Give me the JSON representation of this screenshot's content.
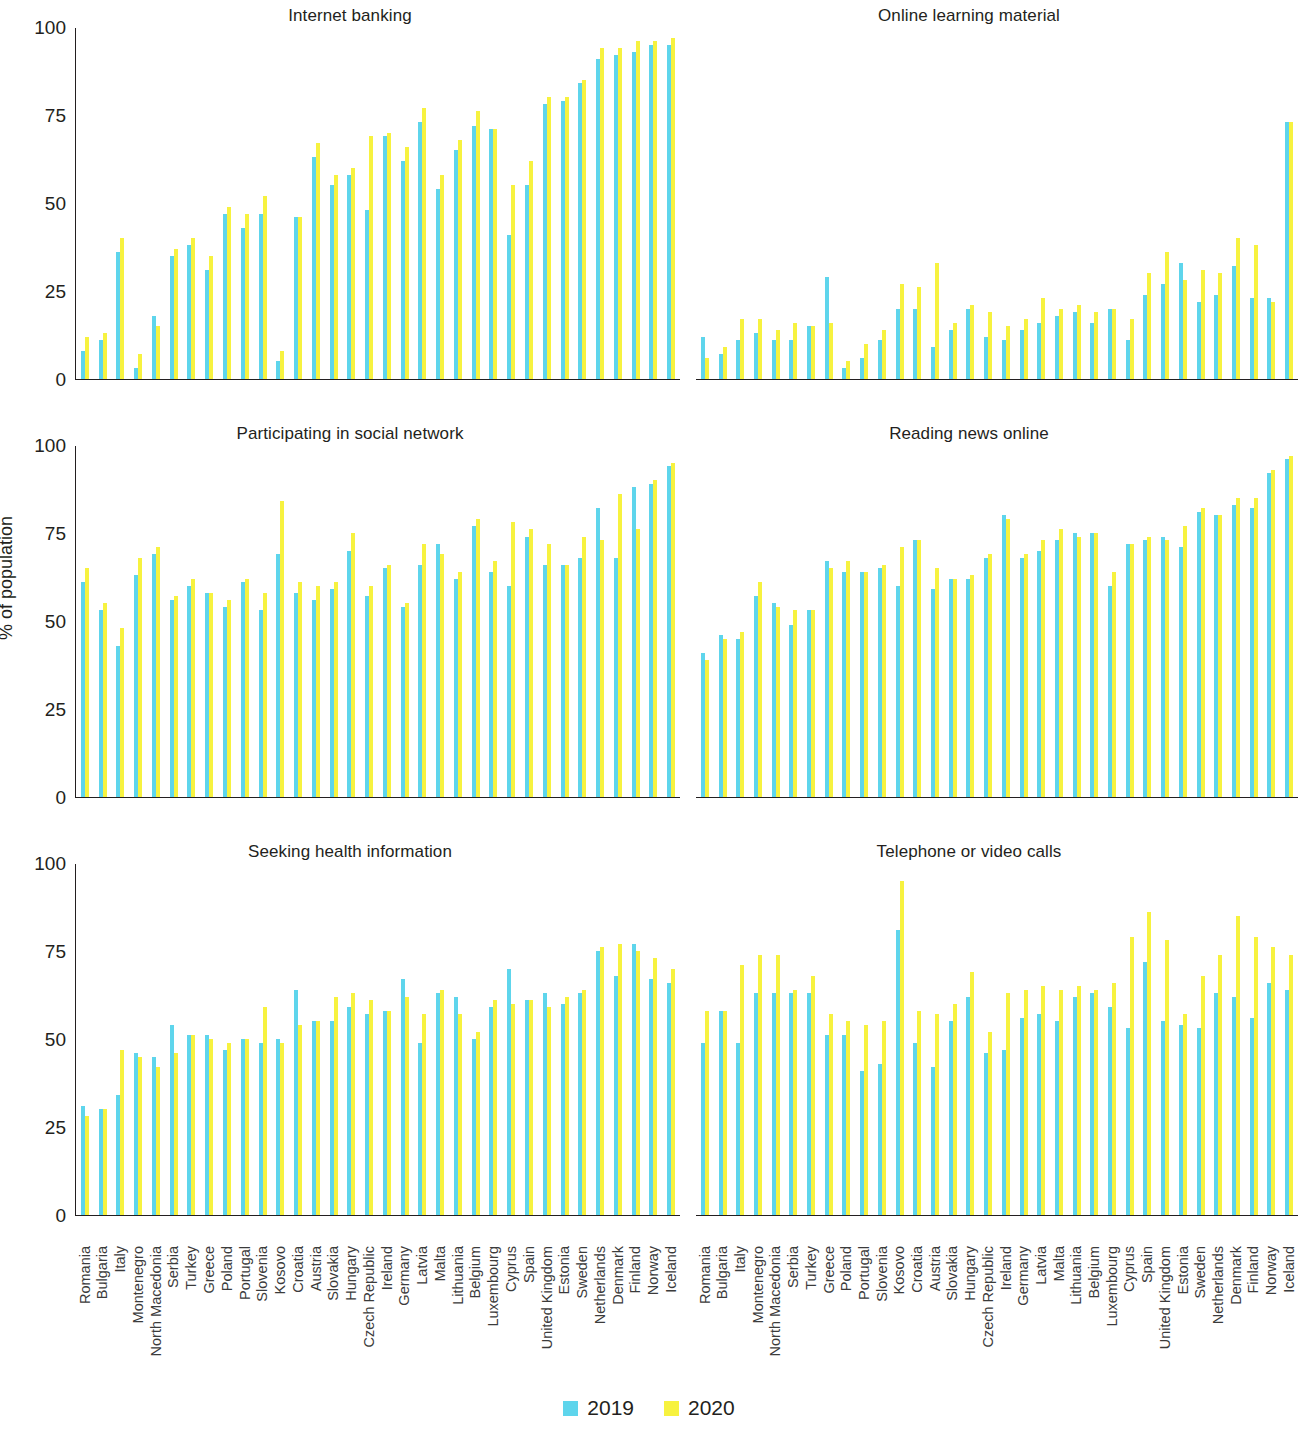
{
  "axis": {
    "ylabel": "% of population",
    "yticks": [
      0,
      25,
      50,
      75,
      100
    ],
    "ymin": 0,
    "ymax": 100
  },
  "legend": {
    "position": "bottom-center",
    "entries": [
      {
        "label": "2019",
        "color": "#5ED5EC"
      },
      {
        "label": "2020",
        "color": "#F7F23F"
      }
    ]
  },
  "colors": {
    "series_2019": "#5ED5EC",
    "series_2020": "#F7F23F",
    "axis": "#231f20",
    "text": "#231f20",
    "background": "#ffffff"
  },
  "countries": [
    "Romania",
    "Bulgaria",
    "Italy",
    "Montenegro",
    "North Macedonia",
    "Serbia",
    "Turkey",
    "Greece",
    "Poland",
    "Portugal",
    "Slovenia",
    "Kosovo",
    "Croatia",
    "Austria",
    "Slovakia",
    "Hungary",
    "Czech Republic",
    "Ireland",
    "Germany",
    "Latvia",
    "Malta",
    "Lithuania",
    "Belgium",
    "Luxembourg",
    "Cyprus",
    "Spain",
    "United Kingdom",
    "Estonia",
    "Sweden",
    "Netherlands",
    "Denmark",
    "Finland",
    "Norway",
    "Iceland"
  ],
  "chart_data": [
    {
      "type": "bar",
      "title": "Internet banking",
      "panel": "top-left",
      "xlabel": "",
      "ylabel": "% of population",
      "ylim": [
        0,
        100
      ],
      "yticks": [
        0,
        25,
        50,
        75,
        100
      ],
      "grid": false,
      "categories": [
        "Romania",
        "Bulgaria",
        "Italy",
        "Montenegro",
        "North Macedonia",
        "Serbia",
        "Turkey",
        "Greece",
        "Poland",
        "Portugal",
        "Slovenia",
        "Kosovo",
        "Croatia",
        "Austria",
        "Slovakia",
        "Hungary",
        "Czech Republic",
        "Ireland",
        "Germany",
        "Latvia",
        "Malta",
        "Lithuania",
        "Belgium",
        "Luxembourg",
        "Cyprus",
        "Spain",
        "United Kingdom",
        "Estonia",
        "Sweden",
        "Netherlands",
        "Denmark",
        "Finland",
        "Norway",
        "Iceland"
      ],
      "series": [
        {
          "name": "2019",
          "color": "#5ED5EC",
          "values": [
            8,
            11,
            36,
            3,
            18,
            35,
            38,
            31,
            47,
            43,
            47,
            5,
            46,
            63,
            55,
            58,
            48,
            69,
            62,
            73,
            54,
            65,
            72,
            71,
            41,
            55,
            78,
            79,
            84,
            91,
            92,
            93,
            95,
            95
          ]
        },
        {
          "name": "2020",
          "color": "#F7F23F",
          "values": [
            12,
            13,
            40,
            7,
            15,
            37,
            40,
            35,
            49,
            47,
            52,
            8,
            46,
            67,
            58,
            60,
            69,
            70,
            66,
            77,
            58,
            68,
            76,
            71,
            55,
            62,
            80,
            80,
            85,
            94,
            94,
            96,
            96,
            97
          ]
        }
      ]
    },
    {
      "type": "bar",
      "title": "Online learning material",
      "panel": "top-right",
      "xlabel": "",
      "ylabel": "",
      "ylim": [
        0,
        100
      ],
      "yticks": [
        0,
        25,
        50,
        75,
        100
      ],
      "grid": false,
      "categories": [
        "Romania",
        "Bulgaria",
        "Italy",
        "Montenegro",
        "North Macedonia",
        "Serbia",
        "Turkey",
        "Greece",
        "Poland",
        "Portugal",
        "Slovenia",
        "Kosovo",
        "Croatia",
        "Austria",
        "Slovakia",
        "Hungary",
        "Czech Republic",
        "Ireland",
        "Germany",
        "Latvia",
        "Malta",
        "Lithuania",
        "Belgium",
        "Luxembourg",
        "Cyprus",
        "Spain",
        "United Kingdom",
        "Estonia",
        "Sweden",
        "Netherlands",
        "Denmark",
        "Finland",
        "Norway",
        "Iceland"
      ],
      "series": [
        {
          "name": "2019",
          "color": "#5ED5EC",
          "values": [
            12,
            7,
            11,
            13,
            11,
            11,
            15,
            29,
            3,
            6,
            11,
            20,
            20,
            9,
            14,
            20,
            12,
            11,
            14,
            16,
            18,
            19,
            16,
            20,
            11,
            24,
            27,
            33,
            22,
            24,
            32,
            23,
            23,
            73
          ]
        },
        {
          "name": "2020",
          "color": "#F7F23F",
          "values": [
            6,
            9,
            17,
            17,
            14,
            16,
            15,
            16,
            5,
            10,
            14,
            27,
            26,
            33,
            16,
            21,
            19,
            15,
            17,
            23,
            20,
            21,
            19,
            20,
            17,
            30,
            36,
            28,
            31,
            30,
            40,
            38,
            22,
            73
          ]
        }
      ]
    },
    {
      "type": "bar",
      "title": "Participating in social network",
      "panel": "middle-left",
      "xlabel": "",
      "ylabel": "% of population",
      "ylim": [
        0,
        100
      ],
      "yticks": [
        0,
        25,
        50,
        75,
        100
      ],
      "grid": false,
      "categories": [
        "Romania",
        "Bulgaria",
        "Italy",
        "Montenegro",
        "North Macedonia",
        "Serbia",
        "Turkey",
        "Greece",
        "Poland",
        "Portugal",
        "Slovenia",
        "Kosovo",
        "Croatia",
        "Austria",
        "Slovakia",
        "Hungary",
        "Czech Republic",
        "Ireland",
        "Germany",
        "Latvia",
        "Malta",
        "Lithuania",
        "Belgium",
        "Luxembourg",
        "Cyprus",
        "Spain",
        "United Kingdom",
        "Estonia",
        "Sweden",
        "Netherlands",
        "Denmark",
        "Finland",
        "Norway",
        "Iceland"
      ],
      "series": [
        {
          "name": "2019",
          "color": "#5ED5EC",
          "values": [
            61,
            53,
            43,
            63,
            69,
            56,
            60,
            58,
            54,
            61,
            53,
            69,
            58,
            56,
            59,
            70,
            57,
            65,
            54,
            66,
            72,
            62,
            77,
            64,
            60,
            74,
            66,
            66,
            68,
            82,
            68,
            88,
            89,
            94
          ]
        },
        {
          "name": "2020",
          "color": "#F7F23F",
          "values": [
            65,
            55,
            48,
            68,
            71,
            57,
            62,
            58,
            56,
            62,
            58,
            84,
            61,
            60,
            61,
            75,
            60,
            66,
            55,
            72,
            69,
            64,
            79,
            67,
            78,
            76,
            72,
            66,
            74,
            73,
            86,
            76,
            90,
            95
          ]
        }
      ]
    },
    {
      "type": "bar",
      "title": "Reading news online",
      "panel": "middle-right",
      "xlabel": "",
      "ylabel": "",
      "ylim": [
        0,
        100
      ],
      "yticks": [
        0,
        25,
        50,
        75,
        100
      ],
      "grid": false,
      "categories": [
        "Romania",
        "Bulgaria",
        "Italy",
        "Montenegro",
        "North Macedonia",
        "Serbia",
        "Turkey",
        "Greece",
        "Poland",
        "Portugal",
        "Slovenia",
        "Kosovo",
        "Croatia",
        "Austria",
        "Slovakia",
        "Hungary",
        "Czech Republic",
        "Ireland",
        "Germany",
        "Latvia",
        "Malta",
        "Lithuania",
        "Belgium",
        "Luxembourg",
        "Cyprus",
        "Spain",
        "United Kingdom",
        "Estonia",
        "Sweden",
        "Netherlands",
        "Denmark",
        "Finland",
        "Norway",
        "Iceland"
      ],
      "series": [
        {
          "name": "2019",
          "color": "#5ED5EC",
          "values": [
            41,
            46,
            45,
            57,
            55,
            49,
            53,
            67,
            64,
            64,
            65,
            60,
            73,
            59,
            62,
            62,
            68,
            80,
            68,
            70,
            73,
            75,
            75,
            60,
            72,
            73,
            74,
            71,
            81,
            80,
            83,
            82,
            92,
            96
          ]
        },
        {
          "name": "2020",
          "color": "#F7F23F",
          "values": [
            39,
            45,
            47,
            61,
            54,
            53,
            53,
            65,
            67,
            64,
            66,
            71,
            73,
            65,
            62,
            63,
            69,
            79,
            69,
            73,
            76,
            74,
            75,
            64,
            72,
            74,
            73,
            77,
            82,
            80,
            85,
            85,
            93,
            97
          ]
        }
      ]
    },
    {
      "type": "bar",
      "title": "Seeking health information",
      "panel": "bottom-left",
      "xlabel": "",
      "ylabel": "% of population",
      "ylim": [
        0,
        100
      ],
      "yticks": [
        0,
        25,
        50,
        75,
        100
      ],
      "grid": false,
      "categories": [
        "Romania",
        "Bulgaria",
        "Italy",
        "Montenegro",
        "North Macedonia",
        "Serbia",
        "Turkey",
        "Greece",
        "Poland",
        "Portugal",
        "Slovenia",
        "Kosovo",
        "Croatia",
        "Austria",
        "Slovakia",
        "Hungary",
        "Czech Republic",
        "Ireland",
        "Germany",
        "Latvia",
        "Malta",
        "Lithuania",
        "Belgium",
        "Luxembourg",
        "Cyprus",
        "Spain",
        "United Kingdom",
        "Estonia",
        "Sweden",
        "Netherlands",
        "Denmark",
        "Finland",
        "Norway",
        "Iceland"
      ],
      "series": [
        {
          "name": "2019",
          "color": "#5ED5EC",
          "values": [
            31,
            30,
            34,
            46,
            45,
            54,
            51,
            51,
            47,
            50,
            49,
            50,
            64,
            55,
            55,
            59,
            57,
            58,
            67,
            49,
            63,
            62,
            50,
            59,
            70,
            61,
            63,
            60,
            63,
            75,
            68,
            77,
            67,
            66
          ]
        },
        {
          "name": "2020",
          "color": "#F7F23F",
          "values": [
            28,
            30,
            47,
            45,
            42,
            46,
            51,
            50,
            49,
            50,
            59,
            49,
            54,
            55,
            62,
            63,
            61,
            58,
            62,
            57,
            64,
            57,
            52,
            61,
            60,
            61,
            59,
            62,
            64,
            76,
            77,
            75,
            73,
            70
          ]
        }
      ]
    },
    {
      "type": "bar",
      "title": "Telephone or video calls",
      "panel": "bottom-right",
      "xlabel": "",
      "ylabel": "",
      "ylim": [
        0,
        100
      ],
      "yticks": [
        0,
        25,
        50,
        75,
        100
      ],
      "grid": false,
      "categories": [
        "Romania",
        "Bulgaria",
        "Italy",
        "Montenegro",
        "North Macedonia",
        "Serbia",
        "Turkey",
        "Greece",
        "Poland",
        "Portugal",
        "Slovenia",
        "Kosovo",
        "Croatia",
        "Austria",
        "Slovakia",
        "Hungary",
        "Czech Republic",
        "Ireland",
        "Germany",
        "Latvia",
        "Malta",
        "Lithuania",
        "Belgium",
        "Luxembourg",
        "Cyprus",
        "Spain",
        "United Kingdom",
        "Estonia",
        "Sweden",
        "Netherlands",
        "Denmark",
        "Finland",
        "Norway",
        "Iceland"
      ],
      "series": [
        {
          "name": "2019",
          "color": "#5ED5EC",
          "values": [
            49,
            58,
            49,
            63,
            63,
            63,
            63,
            51,
            51,
            41,
            43,
            81,
            49,
            42,
            55,
            62,
            46,
            47,
            56,
            57,
            55,
            62,
            63,
            59,
            53,
            72,
            55,
            54,
            53,
            63,
            62,
            56,
            66,
            64
          ]
        },
        {
          "name": "2020",
          "color": "#F7F23F",
          "values": [
            58,
            58,
            71,
            74,
            74,
            64,
            68,
            57,
            55,
            54,
            55,
            95,
            58,
            57,
            60,
            69,
            52,
            63,
            64,
            65,
            64,
            65,
            64,
            66,
            79,
            86,
            78,
            57,
            68,
            74,
            85,
            79,
            76,
            74
          ]
        }
      ]
    }
  ]
}
